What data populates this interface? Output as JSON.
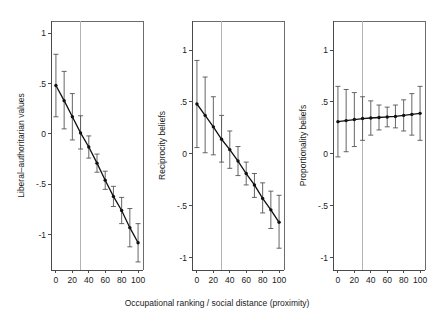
{
  "figure": {
    "background": "#ffffff",
    "xlabel": "Occupational ranking / social distance (proximity)",
    "marker_color": "#111111",
    "errorbar_color": "#555555",
    "refline_color": "#b3b3b3",
    "frame_color": "#6b6b6b"
  },
  "chart_data": [
    {
      "type": "line",
      "panel": 1,
      "title": "",
      "ylabel": "Liberal–authoritarian values",
      "xlabel": "Occupational ranking / social distance (proximity)",
      "xlim": [
        -6,
        106
      ],
      "ylim": [
        -1.35,
        1.12
      ],
      "xticks": [
        0,
        20,
        40,
        60,
        80,
        100
      ],
      "xticklabels": [
        "0",
        "20",
        "40",
        "60",
        "80",
        "100"
      ],
      "yticks": [
        1,
        0.5,
        0,
        -0.5,
        -1
      ],
      "yticklabels": [
        "1",
        ".5",
        "0",
        "-.5",
        "-1"
      ],
      "grid": false,
      "legend": "none",
      "reference_line_x": 30,
      "x": [
        0,
        10,
        20,
        30,
        40,
        50,
        60,
        70,
        80,
        90,
        100
      ],
      "values": [
        0.48,
        0.33,
        0.17,
        0.01,
        -0.13,
        -0.29,
        -0.46,
        -0.62,
        -0.76,
        -0.93,
        -1.08
      ],
      "ci_low": [
        0.17,
        0.05,
        -0.06,
        -0.15,
        -0.24,
        -0.38,
        -0.55,
        -0.72,
        -0.89,
        -1.12,
        -1.27
      ],
      "ci_high": [
        0.79,
        0.62,
        0.4,
        0.18,
        -0.02,
        -0.2,
        -0.37,
        -0.52,
        -0.63,
        -0.74,
        -0.89
      ]
    },
    {
      "type": "line",
      "panel": 2,
      "title": "",
      "ylabel": "Reciprocity beliefs",
      "xlabel": "Occupational ranking / social distance (proximity)",
      "xlim": [
        -6,
        106
      ],
      "ylim": [
        -1.12,
        1.28
      ],
      "xticks": [
        0,
        20,
        40,
        60,
        80,
        100
      ],
      "xticklabels": [
        "0",
        "20",
        "40",
        "60",
        "80",
        "100"
      ],
      "yticks": [
        1,
        0.5,
        0,
        -0.5,
        -1
      ],
      "yticklabels": [
        "1",
        ".5",
        "0",
        "-.5",
        "-1"
      ],
      "grid": false,
      "legend": "none",
      "reference_line_x": 30,
      "x": [
        0,
        10,
        20,
        30,
        40,
        50,
        60,
        70,
        80,
        90,
        100
      ],
      "values": [
        0.48,
        0.37,
        0.26,
        0.14,
        0.04,
        -0.07,
        -0.19,
        -0.3,
        -0.43,
        -0.54,
        -0.66
      ],
      "ci_low": [
        0.06,
        0.01,
        -0.01,
        -0.08,
        -0.14,
        -0.21,
        -0.3,
        -0.42,
        -0.57,
        -0.72,
        -0.91
      ],
      "ci_high": [
        0.9,
        0.74,
        0.55,
        0.37,
        0.22,
        0.07,
        -0.08,
        -0.19,
        -0.28,
        -0.36,
        -0.4
      ]
    },
    {
      "type": "line",
      "panel": 3,
      "title": "",
      "ylabel": "Proportionality beliefs",
      "xlabel": "Occupational ranking / social distance (proximity)",
      "xlim": [
        -6,
        106
      ],
      "ylim": [
        -1.12,
        1.28
      ],
      "xticks": [
        0,
        20,
        40,
        60,
        80,
        100
      ],
      "xticklabels": [
        "0",
        "20",
        "40",
        "60",
        "80",
        "100"
      ],
      "yticks": [
        1,
        0.5,
        0,
        -0.5,
        -1
      ],
      "yticklabels": [
        "1",
        ".5",
        "0",
        "-.5",
        "-1"
      ],
      "grid": false,
      "legend": "none",
      "reference_line_x": 30,
      "x": [
        0,
        10,
        20,
        30,
        40,
        50,
        60,
        70,
        80,
        90,
        100
      ],
      "values": [
        0.31,
        0.32,
        0.33,
        0.34,
        0.345,
        0.35,
        0.355,
        0.36,
        0.37,
        0.38,
        0.39
      ],
      "ci_low": [
        -0.03,
        0.02,
        0.07,
        0.13,
        0.18,
        0.23,
        0.26,
        0.25,
        0.22,
        0.18,
        0.13
      ],
      "ci_high": [
        0.65,
        0.62,
        0.59,
        0.55,
        0.51,
        0.47,
        0.45,
        0.47,
        0.52,
        0.58,
        0.65
      ]
    }
  ]
}
